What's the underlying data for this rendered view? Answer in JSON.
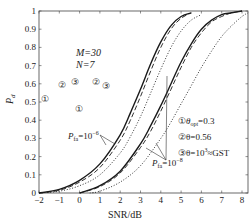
{
  "chart_data": {
    "type": "line",
    "title": "",
    "xlabel": "SNR/dB",
    "ylabel": "P_d",
    "xlim": [
      -2,
      8.3
    ],
    "ylim": [
      0,
      1
    ],
    "x_ticks": [
      "-2",
      "-1",
      "0",
      "1",
      "2",
      "3",
      "4",
      "5",
      "6",
      "7",
      "8"
    ],
    "y_ticks": [
      "0",
      "0.1",
      "0.2",
      "0.3",
      "0.4",
      "0.5",
      "0.6",
      "0.7",
      "0.8",
      "0.9",
      "1"
    ],
    "grid": false,
    "params": {
      "M": "M=30",
      "N": "N=7"
    },
    "legend": [
      {
        "marker": "①",
        "text": "θ_opt=0.3",
        "style": "solid"
      },
      {
        "marker": "②",
        "text": "θ=0.56",
        "style": "dashed"
      },
      {
        "marker": "③",
        "text": "θ=10³≈GST",
        "style": "dotted"
      }
    ],
    "annotations": [
      {
        "text": "P_fa=10^-6",
        "group": "left"
      },
      {
        "text": "P_fa=10^-8",
        "group": "right"
      }
    ],
    "series": [
      {
        "name": "θopt=0.3, Pfa=1e-6",
        "style": "solid",
        "x": [
          -2,
          -1,
          0,
          1,
          2,
          2.5,
          3,
          3.5,
          4,
          4.5,
          5,
          5.5
        ],
        "y": [
          0,
          0.02,
          0.07,
          0.16,
          0.32,
          0.44,
          0.57,
          0.71,
          0.83,
          0.92,
          0.97,
          0.99
        ]
      },
      {
        "name": "θ=0.56, Pfa=1e-6",
        "style": "dashed",
        "x": [
          -2,
          -1,
          0,
          1,
          2,
          2.5,
          3,
          3.5,
          4,
          4.5,
          5,
          5.5
        ],
        "y": [
          0,
          0.015,
          0.06,
          0.14,
          0.29,
          0.4,
          0.53,
          0.67,
          0.8,
          0.9,
          0.96,
          0.99
        ]
      },
      {
        "name": "θ=10³ (GST), Pfa=1e-6",
        "style": "dotted",
        "x": [
          -2,
          -1,
          0,
          1,
          2,
          2.5,
          3,
          3.5,
          4,
          4.5,
          5,
          5.5,
          6
        ],
        "y": [
          0,
          0.01,
          0.04,
          0.1,
          0.22,
          0.31,
          0.42,
          0.55,
          0.68,
          0.8,
          0.89,
          0.95,
          0.98
        ]
      },
      {
        "name": "θopt=0.3, Pfa=1e-8",
        "style": "solid",
        "x": [
          0,
          1,
          2,
          3,
          3.5,
          4,
          4.5,
          5,
          5.5,
          6,
          6.5,
          7,
          7.5,
          8
        ],
        "y": [
          0,
          0.04,
          0.12,
          0.27,
          0.37,
          0.48,
          0.6,
          0.72,
          0.82,
          0.9,
          0.95,
          0.98,
          0.99,
          1.0
        ]
      },
      {
        "name": "θ=0.56, Pfa=1e-8",
        "style": "dashed",
        "x": [
          0,
          1,
          2,
          3,
          3.5,
          4,
          4.5,
          5,
          5.5,
          6,
          6.5,
          7,
          7.5,
          8
        ],
        "y": [
          0,
          0.035,
          0.11,
          0.25,
          0.34,
          0.45,
          0.57,
          0.69,
          0.8,
          0.88,
          0.94,
          0.97,
          0.99,
          1.0
        ]
      },
      {
        "name": "θ=10³ (GST), Pfa=1e-8",
        "style": "dotted",
        "x": [
          0.5,
          1,
          2,
          3,
          4,
          4.5,
          5,
          5.5,
          6,
          6.5,
          7,
          7.5,
          8,
          8.3
        ],
        "y": [
          0,
          0.01,
          0.06,
          0.15,
          0.3,
          0.39,
          0.49,
          0.59,
          0.69,
          0.78,
          0.86,
          0.92,
          0.97,
          0.99
        ]
      }
    ]
  },
  "labels": {
    "m": "M=30",
    "n": "N=7",
    "ylabel": "P",
    "ylabel_sub": "d",
    "xlabel": "SNR/dB",
    "pfa6_main": "P",
    "pfa6_sub": "fa",
    "pfa6_eq": "=10",
    "pfa6_exp": "−6",
    "pfa8_main": "P",
    "pfa8_sub": "fa",
    "pfa8_eq": "=10",
    "pfa8_exp": "−8",
    "leg1_mark": "①",
    "leg1_theta": "θ",
    "leg1_sub": "opt",
    "leg1_val": "=0.3",
    "leg2": "②θ=0.56",
    "leg3_a": "③θ=10",
    "leg3_exp": "3",
    "leg3_b": "≈GST",
    "c1": "①",
    "c2": "②",
    "c3": "③"
  }
}
